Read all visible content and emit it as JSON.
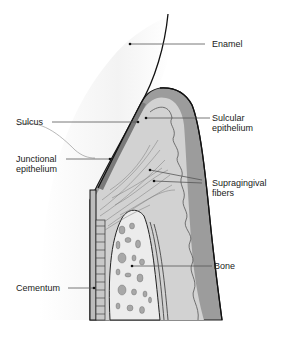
{
  "colors": {
    "background": "#ffffff",
    "outline": "#1a1a1a",
    "gingiva_outer": "#9a9a9a",
    "gingiva_inner": "#cfcfcf",
    "connective": "#d9d9d9",
    "bone": "#e6e6e6",
    "bone_spots": "#a8a8a8",
    "tooth_shade": "#f3f3f3",
    "leader": "#555555"
  },
  "labels": {
    "enamel": "Enamel",
    "sulcus": "Sulcus",
    "sulcular_1": "Sulcular",
    "sulcular_2": "epithelium",
    "junctional_1": "Junctional",
    "junctional_2": "epithelium",
    "supragingival_1": "Supragingival",
    "supragingival_2": "fibers",
    "bone": "Bone",
    "cementum": "Cementum"
  }
}
